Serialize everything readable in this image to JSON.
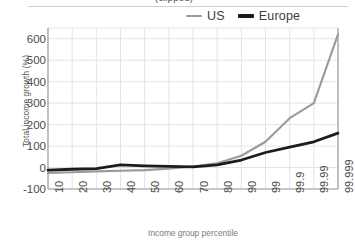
{
  "figure": {
    "title_partial": "(clipped)",
    "background": "#ffffff",
    "grid_color": "#e3e3e3",
    "axis_color": "#9e9e9e"
  },
  "legend": {
    "position": "top-right",
    "entries": [
      {
        "label": "US",
        "color": "#9a9a9a"
      },
      {
        "label": "Europe",
        "color": "#1c1c1c"
      }
    ]
  },
  "chart_data": {
    "type": "line",
    "title": "",
    "xlabel": "Income group percentile",
    "ylabel": "Total income growth (%)",
    "categories": [
      "10",
      "20",
      "30",
      "40",
      "50",
      "60",
      "70",
      "80",
      "90",
      "99",
      "99.9",
      "99.99",
      "99.999"
    ],
    "xtick_labels": [
      "10",
      "20",
      "30",
      "40",
      "50",
      "60",
      "70",
      "80",
      "90",
      "99",
      "99.9",
      "99.99",
      "99.999"
    ],
    "ytick_labels": [
      "600",
      "500",
      "400",
      "300",
      "200",
      "100",
      "0",
      "-100"
    ],
    "yticks": [
      600,
      500,
      400,
      300,
      200,
      100,
      0,
      -100
    ],
    "ylim": [
      -100,
      650
    ],
    "grid": true,
    "legend_position": "top-right",
    "series": [
      {
        "name": "US",
        "color": "#9a9a9a",
        "values": [
          -25,
          -22,
          -18,
          -15,
          -12,
          -5,
          5,
          20,
          55,
          120,
          230,
          300,
          620
        ]
      },
      {
        "name": "Europe",
        "color": "#1c1c1c",
        "values": [
          -12,
          -8,
          -5,
          12,
          8,
          5,
          3,
          12,
          35,
          70,
          95,
          120,
          160
        ]
      }
    ]
  }
}
